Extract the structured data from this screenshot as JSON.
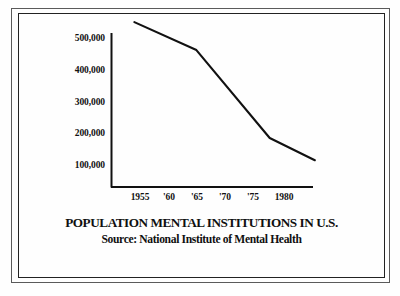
{
  "frame": {
    "style_name": "double-rule-border"
  },
  "chart_data": {
    "type": "line",
    "title": "POPULATION MENTAL INSTITUTIONS IN U.S.",
    "subtitle": "Source: National Institute of Mental Health",
    "xlabel": "",
    "ylabel": "",
    "grid": false,
    "legend": "none",
    "xlim": [
      1954,
      1986
    ],
    "ylim": [
      0,
      560000
    ],
    "ytick_labels": [
      "500,000",
      "400,000",
      "300,000",
      "200,000",
      "100,000"
    ],
    "ytick_values": [
      500000,
      400000,
      300000,
      200000,
      100000
    ],
    "xtick_labels": [
      "1955",
      "'60",
      "'65",
      "'70",
      "'75",
      "1980"
    ],
    "xtick_values": [
      1955,
      1960,
      1965,
      1970,
      1975,
      1980
    ],
    "series": [
      {
        "name": "Population in mental institutions",
        "x": [
          1954,
          1965,
          1978,
          1986
        ],
        "values": [
          550000,
          462000,
          185000,
          115000
        ]
      }
    ],
    "line_color": "#111111",
    "axis_color": "#111111"
  }
}
